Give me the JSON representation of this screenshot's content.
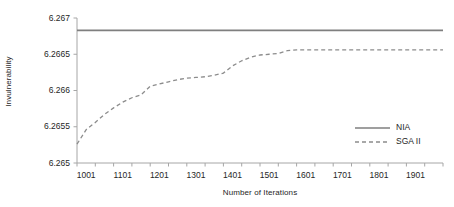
{
  "chart_data": {
    "type": "line",
    "title": "",
    "xlabel": "Number of Iterations",
    "ylabel": "Invulnerability",
    "xtick_labels": [
      "1001",
      "1101",
      "1201",
      "1301",
      "1401",
      "1501",
      "1601",
      "1701",
      "1801",
      "1901"
    ],
    "ytick_labels": [
      "6.265",
      "6.2655",
      "6.266",
      "6.2665",
      "6.267"
    ],
    "xlim": [
      1001,
      2001
    ],
    "ylim": [
      6.265,
      6.267
    ],
    "grid": false,
    "legend_position": "inside-lower-right",
    "series": [
      {
        "name": "NIA",
        "style": "solid",
        "color": "#7f7f7f",
        "constant_value": 6.26683,
        "x": [
          1001,
          2001
        ],
        "values": [
          6.26683,
          6.26683
        ]
      },
      {
        "name": "SGA II",
        "style": "dashed",
        "color": "#8c8c8c",
        "x": [
          1001,
          1026,
          1051,
          1076,
          1101,
          1126,
          1151,
          1176,
          1201,
          1226,
          1251,
          1276,
          1301,
          1326,
          1351,
          1376,
          1401,
          1426,
          1451,
          1476,
          1501,
          1526,
          1551,
          1576,
          1601,
          1651,
          1701,
          1751,
          1801,
          1851,
          1901,
          1951,
          2001
        ],
        "values": [
          6.26526,
          6.26546,
          6.26556,
          6.26567,
          6.26576,
          6.26584,
          6.2659,
          6.26594,
          6.26606,
          6.26609,
          6.26612,
          6.26615,
          6.26617,
          6.26618,
          6.26619,
          6.26621,
          6.26624,
          6.26634,
          6.26641,
          6.26646,
          6.26649,
          6.2665,
          6.26651,
          6.26655,
          6.26656,
          6.26656,
          6.26656,
          6.26656,
          6.26656,
          6.26656,
          6.26656,
          6.26656,
          6.26656
        ]
      }
    ],
    "legend": [
      {
        "label": "NIA",
        "style": "solid"
      },
      {
        "label": "SGA II",
        "style": "dashed"
      }
    ]
  },
  "colors": {
    "axis": "#a6a6a6",
    "text": "#262626",
    "nia_line": "#7f7f7f",
    "sga_line": "#8c8c8c"
  }
}
